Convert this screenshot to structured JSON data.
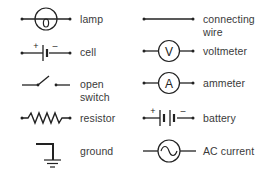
{
  "diagram": {
    "title": "",
    "stroke_color": "#222222",
    "label_color": "#3a3a3a",
    "left_column": [
      {
        "id": "lamp",
        "icon": "lamp-icon",
        "label_lines": [
          "lamp"
        ]
      },
      {
        "id": "cell",
        "icon": "cell-icon",
        "label_lines": [
          "cell"
        ],
        "marks": {
          "plus": "+",
          "minus": "–"
        }
      },
      {
        "id": "open-switch",
        "icon": "open-switch-icon",
        "label_lines": [
          "open",
          "switch"
        ]
      },
      {
        "id": "resistor",
        "icon": "resistor-icon",
        "label_lines": [
          "resistor"
        ]
      },
      {
        "id": "ground",
        "icon": "ground-icon",
        "label_lines": [
          "ground"
        ]
      }
    ],
    "right_column": [
      {
        "id": "connecting-wire",
        "icon": "wire-icon",
        "label_lines": [
          "connecting",
          "wire"
        ]
      },
      {
        "id": "voltmeter",
        "icon": "voltmeter-icon",
        "label_lines": [
          "voltmeter"
        ],
        "glyph": "V"
      },
      {
        "id": "ammeter",
        "icon": "ammeter-icon",
        "label_lines": [
          "ammeter"
        ],
        "glyph": "A"
      },
      {
        "id": "battery",
        "icon": "battery-icon",
        "label_lines": [
          "battery"
        ],
        "marks": {
          "plus": "+",
          "minus": "–"
        }
      },
      {
        "id": "ac-current",
        "icon": "ac-source-icon",
        "label_lines": [
          "AC current"
        ]
      }
    ]
  }
}
